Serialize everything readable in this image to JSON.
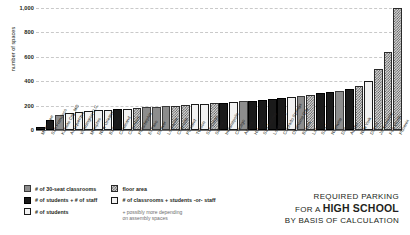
{
  "chart_data": {
    "type": "bar",
    "title": "REQUIRED PARKING FOR A HIGH SCHOOL BY BASIS OF CALCULATION",
    "xlabel": "",
    "ylabel": "number of spaces",
    "ylim": [
      0,
      1000
    ],
    "yticks": [
      "0",
      "200",
      "400",
      "600",
      "800",
      "1,000"
    ],
    "grid": true,
    "legend_position": "below-left",
    "categories": [
      "Milwaukee",
      "San Francisco",
      "Kansas City, MO",
      "Albuquerque",
      "Washington D.C.",
      "Memphis",
      "New Orleans",
      "Baltimore",
      "Cleveland",
      "Columbus",
      "Philadelphia",
      "El Paso",
      "Denver",
      "Louisville",
      "Charlotte",
      "Portland",
      "Tucson",
      "San Diego",
      "Seattle",
      "Indianapolis",
      "Chicago",
      "Atlanta",
      "Houston",
      "San Antonio",
      "Long Beach",
      "Colorado Springs",
      "Oklahoma City",
      "Boston",
      "Las Vegas",
      "San Jose",
      "Nashville",
      "Dallas",
      "Austin",
      "New York",
      "Detroit",
      "Jacksonville",
      "Fort Worth",
      "Phoenix"
    ],
    "values": [
      25,
      85,
      120,
      140,
      150,
      155,
      160,
      165,
      170,
      175,
      180,
      185,
      190,
      195,
      200,
      205,
      210,
      215,
      220,
      225,
      230,
      235,
      240,
      250,
      255,
      260,
      270,
      280,
      290,
      300,
      310,
      320,
      340,
      360,
      400,
      500,
      640,
      1000
    ],
    "patterns": [
      "dark",
      "dark",
      "gray",
      "light",
      "light",
      "light",
      "light",
      "light",
      "dark",
      "light",
      "check",
      "gray",
      "gray",
      "gray",
      "check",
      "check",
      "light",
      "light",
      "check",
      "dark",
      "light",
      "gray",
      "dark",
      "dark",
      "dark",
      "dark",
      "light",
      "gray",
      "check",
      "dark",
      "dark",
      "gray",
      "dark",
      "check",
      "light",
      "check",
      "check",
      "check"
    ]
  },
  "legend": {
    "columns": [
      {
        "items": [
          {
            "label": "# of 30-seat classrooms",
            "pattern": "gray"
          },
          {
            "label": "# of students + # of staff",
            "pattern": "dark"
          },
          {
            "label": "# of students",
            "pattern": "light"
          }
        ]
      },
      {
        "items": [
          {
            "label": "floor area",
            "pattern": "check"
          },
          {
            "label": "# of classrooms + students -or- staff",
            "pattern": "light"
          }
        ],
        "note_line1": "+ possibly more depending",
        "note_line2": "on assembly spaces"
      }
    ]
  },
  "titleblock": {
    "line1": "REQUIRED PARKING",
    "line2_prefix": "FOR A ",
    "line2_bold": "HIGH SCHOOL",
    "line3": "BY BASIS OF CALCULATION"
  }
}
